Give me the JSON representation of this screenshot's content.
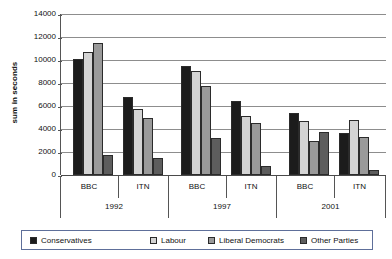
{
  "chart_data": {
    "type": "bar",
    "title": "",
    "subtitle": "",
    "xlabel": "",
    "ylabel": "sum in seconds",
    "ylim": [
      0,
      14000
    ],
    "ytick_step": 2000,
    "yticks": [
      14000,
      12000,
      10000,
      8000,
      6000,
      4000,
      2000,
      0
    ],
    "ytick_labels": [
      "14000",
      "12000",
      "10000",
      "8000",
      "6000",
      "4000",
      "2000",
      "0"
    ],
    "grid": true,
    "legend_position": "bottom",
    "categories": [
      "BBC",
      "ITN",
      "BBC",
      "ITN",
      "BBC",
      "ITN"
    ],
    "groups": [
      {
        "year": "1992",
        "outlets": [
          {
            "outlet": "BBC",
            "values": [
              10100,
              10700,
              11500,
              1700
            ]
          },
          {
            "outlet": "ITN",
            "values": [
              6800,
              5700,
              5000,
              1450
            ]
          }
        ]
      },
      {
        "year": "1997",
        "outlets": [
          {
            "outlet": "BBC",
            "values": [
              9500,
              9050,
              7700,
              3200
            ]
          },
          {
            "outlet": "ITN",
            "values": [
              6400,
              5100,
              4550,
              750
            ]
          }
        ]
      },
      {
        "year": "2001",
        "outlets": [
          {
            "outlet": "BBC",
            "values": [
              5350,
              4700,
              3000,
              3700
            ]
          },
          {
            "outlet": "ITN",
            "values": [
              3650,
              4750,
              3300,
              450
            ]
          }
        ]
      }
    ],
    "series": [
      {
        "name": "Conservatives",
        "color": "#1c1c1c",
        "values": [
          10100,
          6800,
          9500,
          6400,
          5350,
          3650
        ]
      },
      {
        "name": "Labour",
        "color": "#d4d4d4",
        "values": [
          10700,
          5700,
          9050,
          5100,
          4700,
          4750
        ]
      },
      {
        "name": "Liberal Democrats",
        "color": "#9a9a9a",
        "values": [
          11500,
          5000,
          7700,
          4550,
          3000,
          3300
        ]
      },
      {
        "name": "Other Parties",
        "color": "#5d5d5d",
        "values": [
          1700,
          1450,
          3200,
          750,
          3700,
          450
        ]
      }
    ]
  },
  "legend": {
    "items": [
      {
        "label": "Conservatives",
        "color": "#1c1c1c"
      },
      {
        "label": "Labour",
        "color": "#d4d4d4"
      },
      {
        "label": "Liberal Democrats",
        "color": "#9a9a9a"
      },
      {
        "label": "Other Parties",
        "color": "#5d5d5d"
      }
    ]
  }
}
